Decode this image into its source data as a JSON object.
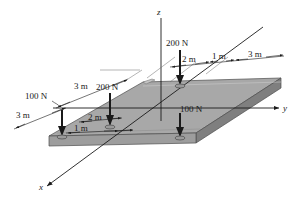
{
  "figure": {
    "axes": {
      "z_label": "z",
      "y_label": "y",
      "x_label": "x"
    },
    "forces": [
      {
        "name": "force-200n-rear",
        "label": "200 N",
        "magnitude": 200,
        "unit": "N",
        "direction": "down"
      },
      {
        "name": "force-200n-front",
        "label": "200 N",
        "magnitude": 200,
        "unit": "N",
        "direction": "down"
      },
      {
        "name": "force-100n-left",
        "label": "100 N",
        "magnitude": 100,
        "unit": "N",
        "direction": "down"
      },
      {
        "name": "force-100n-right",
        "label": "100 N",
        "magnitude": 100,
        "unit": "N",
        "direction": "down"
      }
    ],
    "dimensions": [
      {
        "name": "dim-top-2m",
        "label": "2 m",
        "value": 2,
        "unit": "m"
      },
      {
        "name": "dim-top-1m",
        "label": "1 m",
        "value": 1,
        "unit": "m"
      },
      {
        "name": "dim-top-3m",
        "label": "3 m",
        "value": 3,
        "unit": "m"
      },
      {
        "name": "dim-left-3m",
        "label": "3 m",
        "value": 3,
        "unit": "m"
      },
      {
        "name": "dim-lower-3m",
        "label": "3 m",
        "value": 3,
        "unit": "m"
      },
      {
        "name": "dim-front-2m",
        "label": "2 m",
        "value": 2,
        "unit": "m"
      },
      {
        "name": "dim-front-1m",
        "label": "1 m",
        "value": 1,
        "unit": "m"
      }
    ],
    "colors": {
      "plate_top": "#a8a8a8",
      "plate_side": "#8f8f8f",
      "plate_front": "#bdbdbd",
      "plate_edge": "#4d4d4d",
      "line": "#1a1a1a",
      "background": "#ffffff"
    }
  }
}
